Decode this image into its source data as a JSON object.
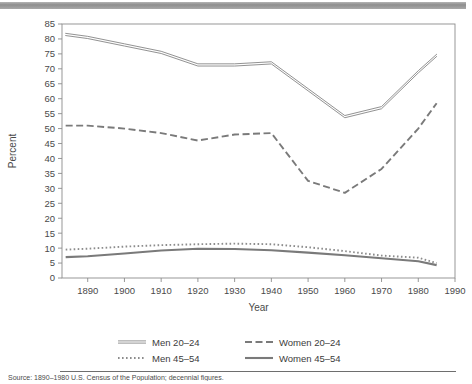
{
  "topbar": {
    "color": "#9a9a9a"
  },
  "axes": {
    "ylabel": "Percent",
    "xlabel": "Year",
    "y_ticks": [
      "0",
      "5",
      "10",
      "15",
      "20",
      "25",
      "30",
      "35",
      "40",
      "45",
      "50",
      "55",
      "60",
      "65",
      "70",
      "75",
      "80",
      "85"
    ],
    "x_ticks": [
      "1890",
      "1900",
      "1910",
      "1920",
      "1930",
      "1940",
      "1950",
      "1960",
      "1970",
      "1980",
      "1990"
    ]
  },
  "legend": {
    "items": [
      {
        "label": "Men 20–24",
        "style": "solid-thin",
        "color": "#8c8c8c"
      },
      {
        "label": "Women 20–24",
        "style": "dashed",
        "color": "#7a7a7a"
      },
      {
        "label": "Men 45–54",
        "style": "dotted",
        "color": "#8c8c8c"
      },
      {
        "label": "Women 45–54",
        "style": "solid-thick",
        "color": "#7a7a7a"
      }
    ]
  },
  "footer": {
    "source": "Source: 1890–1980 U.S. Census of the Population; decennial figures."
  },
  "chart_data": {
    "type": "line",
    "title": "",
    "xlabel": "Year",
    "ylabel": "Percent",
    "xlim": [
      1883,
      1990
    ],
    "ylim": [
      0,
      85
    ],
    "grid": false,
    "legend_position": "bottom",
    "series": [
      {
        "name": "Men 20–24",
        "style": "solid-thin",
        "color": "#8c8c8c",
        "x": [
          1884,
          1890,
          1900,
          1910,
          1920,
          1930,
          1940,
          1950,
          1960,
          1970,
          1980,
          1985
        ],
        "values": [
          81.5,
          80.5,
          78.0,
          75.5,
          71.3,
          71.3,
          72.0,
          63.0,
          54.0,
          57.0,
          69.0,
          74.5
        ]
      },
      {
        "name": "Women 20–24",
        "style": "dashed",
        "color": "#7a7a7a",
        "x": [
          1884,
          1890,
          1900,
          1910,
          1920,
          1930,
          1940,
          1950,
          1960,
          1970,
          1980,
          1985
        ],
        "values": [
          51.0,
          51.0,
          50.0,
          48.5,
          46.0,
          48.0,
          48.5,
          32.5,
          28.5,
          36.5,
          50.0,
          58.5
        ]
      },
      {
        "name": "Men 45–54",
        "style": "dotted",
        "color": "#8c8c8c",
        "x": [
          1884,
          1890,
          1900,
          1910,
          1920,
          1930,
          1940,
          1950,
          1960,
          1970,
          1980,
          1985
        ],
        "values": [
          9.5,
          9.8,
          10.5,
          11.0,
          11.3,
          11.5,
          11.3,
          10.3,
          9.0,
          7.5,
          6.8,
          5.0
        ]
      },
      {
        "name": "Women 45–54",
        "style": "solid-thick",
        "color": "#7a7a7a",
        "x": [
          1884,
          1890,
          1900,
          1910,
          1920,
          1930,
          1940,
          1950,
          1960,
          1970,
          1980,
          1985
        ],
        "values": [
          7.0,
          7.3,
          8.2,
          9.2,
          9.8,
          9.7,
          9.3,
          8.5,
          7.6,
          6.6,
          5.6,
          4.3
        ]
      }
    ]
  }
}
